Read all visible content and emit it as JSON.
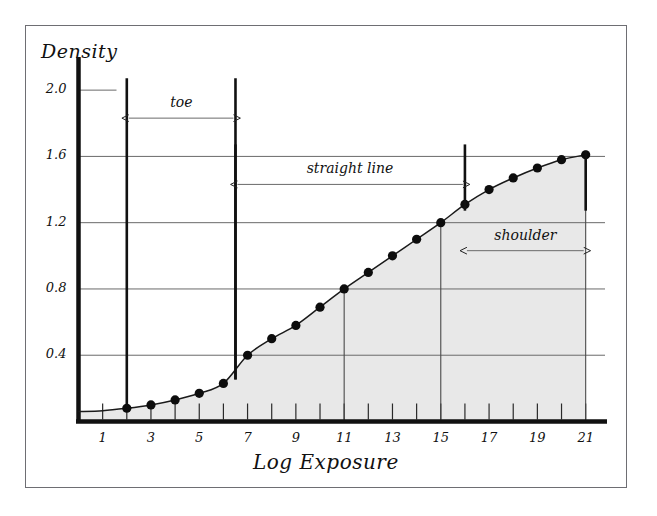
{
  "figure": {
    "background_color": "#ffffff",
    "frame_color": "#6e6e73",
    "ink_color": "#111111",
    "fill_color": "#e8e8e8"
  },
  "chart_data": {
    "type": "line",
    "title": "",
    "xlabel": "Log Exposure",
    "ylabel": "Density",
    "xlim": [
      0,
      21.8
    ],
    "ylim": [
      0,
      2.2
    ],
    "grid": true,
    "grid_axis": "y",
    "legend": "none",
    "x": [
      2,
      3,
      4,
      5,
      6,
      7,
      8,
      9,
      10,
      11,
      12,
      13,
      14,
      15,
      16,
      17,
      18,
      19,
      20,
      21
    ],
    "values": [
      0.08,
      0.1,
      0.13,
      0.17,
      0.23,
      0.4,
      0.5,
      0.58,
      0.69,
      0.8,
      0.9,
      1.0,
      1.1,
      1.2,
      1.31,
      1.4,
      1.47,
      1.53,
      1.58,
      1.61
    ],
    "series": [
      {
        "name": "characteristic curve",
        "values": [
          0.08,
          0.1,
          0.13,
          0.17,
          0.23,
          0.4,
          0.5,
          0.58,
          0.69,
          0.8,
          0.9,
          1.0,
          1.1,
          1.2,
          1.31,
          1.4,
          1.47,
          1.53,
          1.58,
          1.61
        ]
      }
    ],
    "ytick_labels": [
      "0.4",
      "0.8",
      "1.2",
      "1.6",
      "2.0"
    ],
    "ytick_values": [
      0.4,
      0.8,
      1.2,
      1.6,
      2.0
    ],
    "xtick_labels": [
      "1",
      "3",
      "5",
      "7",
      "9",
      "11",
      "13",
      "15",
      "17",
      "19",
      "21"
    ],
    "xtick_values": [
      1,
      3,
      5,
      7,
      9,
      11,
      13,
      15,
      17,
      19,
      21
    ],
    "xtick_minor_values": [
      1,
      2,
      3,
      4,
      5,
      6,
      7,
      8,
      9,
      10,
      11,
      12,
      13,
      14,
      15,
      16,
      17,
      18,
      19,
      20,
      21
    ],
    "dropline_x": [
      11,
      15,
      21
    ],
    "annotations": [
      {
        "label": "toe",
        "x_start": 2,
        "x_end": 6.5,
        "y_top": 2.0
      },
      {
        "label": "straight line",
        "x_start": 6.5,
        "x_end": 16,
        "y_top": 1.6
      },
      {
        "label": "shoulder",
        "x_start": 16,
        "x_end": 21,
        "y_top": 1.2
      }
    ],
    "fill_under_curve": true
  }
}
